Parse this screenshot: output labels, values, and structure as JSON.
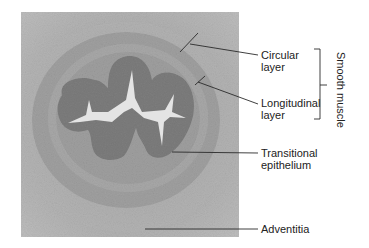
{
  "figure": {
    "colors": {
      "background": "#ffffff",
      "micrograph_outer": "#b3b3b3",
      "muscle_ring": "#9c9c9c",
      "epithelium": "#7f7f7f",
      "lumen": "#e3e3e3",
      "leader_line": "#2a2a2a"
    }
  },
  "labels": {
    "circular": {
      "line1": "Circular",
      "line2": "layer"
    },
    "longitudinal": {
      "line1": "Longitudinal",
      "line2": "layer"
    },
    "transitional": {
      "line1": "Transitional",
      "line2": "epithelium"
    },
    "adventitia": {
      "line1": "Adventitia"
    },
    "group": "Smooth muscle"
  }
}
